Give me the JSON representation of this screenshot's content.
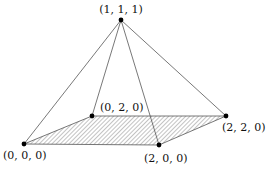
{
  "diagram": {
    "type": "pyramid",
    "vertices": [
      {
        "id": "apex",
        "label": "(1, 1, 1)",
        "x": 121,
        "y": 20,
        "lx": 121,
        "ly": 13,
        "anchor": "middle"
      },
      {
        "id": "v020",
        "label": "(0, 2, 0)",
        "x": 92,
        "y": 116,
        "lx": 100,
        "ly": 111,
        "anchor": "start"
      },
      {
        "id": "v220",
        "label": "(2, 2, 0)",
        "x": 226,
        "y": 116,
        "lx": 222,
        "ly": 131,
        "anchor": "start"
      },
      {
        "id": "v000",
        "label": "(0, 0, 0)",
        "x": 24,
        "y": 144,
        "lx": 3,
        "ly": 159,
        "anchor": "start"
      },
      {
        "id": "v200",
        "label": "(2, 0, 0)",
        "x": 159,
        "y": 145,
        "lx": 144,
        "ly": 162,
        "anchor": "start"
      }
    ],
    "edges": [
      [
        "apex",
        "v000"
      ],
      [
        "apex",
        "v020"
      ],
      [
        "apex",
        "v200"
      ],
      [
        "apex",
        "v220"
      ],
      [
        "v000",
        "v020"
      ],
      [
        "v020",
        "v220"
      ],
      [
        "v220",
        "v200"
      ],
      [
        "v200",
        "v000"
      ]
    ],
    "base_fill": "hatched",
    "colors": {
      "line": "#555555",
      "point": "#000000",
      "hatch": "#777777"
    }
  }
}
